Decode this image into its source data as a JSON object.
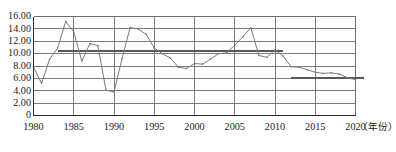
{
  "chart_data": {
    "type": "line",
    "title": "",
    "subtitle": "",
    "xlabel": "（年份）",
    "ylabel": "",
    "grid": true,
    "legend": "none",
    "xlim": [
      1980,
      2020
    ],
    "ylim": [
      0,
      16
    ],
    "x": [
      1980,
      1981,
      1982,
      1983,
      1984,
      1985,
      1986,
      1987,
      1988,
      1989,
      1990,
      1991,
      1992,
      1993,
      1994,
      1995,
      1996,
      1997,
      1998,
      1999,
      2000,
      2001,
      2002,
      2003,
      2004,
      2005,
      2006,
      2007,
      2008,
      2009,
      2010,
      2011,
      2012,
      2013,
      2014,
      2015,
      2016,
      2017,
      2018,
      2019,
      2020
    ],
    "values": [
      7.8,
      5.2,
      9.1,
      10.9,
      15.2,
      13.5,
      8.8,
      11.6,
      11.3,
      4.1,
      3.8,
      9.2,
      14.2,
      14.0,
      13.1,
      10.9,
      10.0,
      9.3,
      7.8,
      7.6,
      8.4,
      8.3,
      9.1,
      10.0,
      10.1,
      11.4,
      12.7,
      14.2,
      9.7,
      9.4,
      10.6,
      9.6,
      7.9,
      7.8,
      7.4,
      7.0,
      6.8,
      6.9,
      6.7,
      6.1,
      5.8
    ],
    "series": [
      {
        "name": "年度增长率",
        "values": [
          7.8,
          5.2,
          9.1,
          10.9,
          15.2,
          13.5,
          8.8,
          11.6,
          11.3,
          4.1,
          3.8,
          9.2,
          14.2,
          14.0,
          13.1,
          10.9,
          10.0,
          9.3,
          7.8,
          7.6,
          8.4,
          8.3,
          9.1,
          10.0,
          10.1,
          11.4,
          12.7,
          14.2,
          9.7,
          9.4,
          10.6,
          9.6,
          7.9,
          7.8,
          7.4,
          7.0,
          6.8,
          6.9,
          6.7,
          6.1,
          5.8
        ]
      }
    ],
    "reference_lines": [
      {
        "name": "平均线1",
        "y": 10.4,
        "x_start": 1983,
        "x_end": 2011
      },
      {
        "name": "平均线2",
        "y": 6.0,
        "x_start": 2012,
        "x_end": 2021
      }
    ],
    "yticks": [
      "0",
      "2.00",
      "4.00",
      "6.00",
      "8.00",
      "10.00",
      "12.00",
      "14.00",
      "16.00"
    ],
    "ytick_values": [
      0,
      2,
      4,
      6,
      8,
      10,
      12,
      14,
      16
    ],
    "xticks": [
      "1980",
      "1985",
      "1990",
      "1995",
      "2000",
      "2005",
      "2010",
      "2015",
      "2020"
    ],
    "xtick_values": [
      1980,
      1985,
      1990,
      1995,
      2000,
      2005,
      2010,
      2015,
      2020
    ],
    "colors": {
      "line": "#7a7a7a",
      "grid": "#6e6e6e",
      "axis": "#2b2b2b",
      "reference": "#585858",
      "background": "#ffffff"
    }
  }
}
